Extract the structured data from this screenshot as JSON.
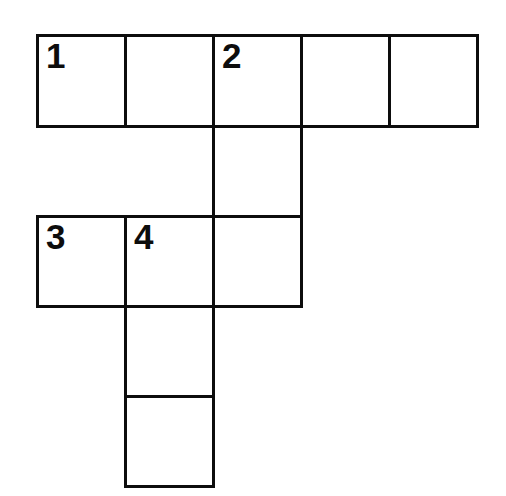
{
  "puzzle": {
    "type": "crossword-grid",
    "title": "Crossword Puzzle Grid",
    "background_color": "#ffffff",
    "line_color": "#0d0d0d",
    "line_width_px": 3,
    "cell_size_px": 88,
    "origin": {
      "x": 36,
      "y": 34
    },
    "columns": 5,
    "rows": 5,
    "column_edges_px": [
      36,
      124,
      212,
      300,
      388,
      476
    ],
    "row_edges_px": [
      34,
      125,
      215,
      305,
      395,
      485
    ],
    "cells": [
      {
        "row": 0,
        "col": 0,
        "number": "1",
        "letter": ""
      },
      {
        "row": 0,
        "col": 1,
        "number": "",
        "letter": ""
      },
      {
        "row": 0,
        "col": 2,
        "number": "2",
        "letter": ""
      },
      {
        "row": 0,
        "col": 3,
        "number": "",
        "letter": ""
      },
      {
        "row": 0,
        "col": 4,
        "number": "",
        "letter": ""
      },
      {
        "row": 1,
        "col": 2,
        "number": "",
        "letter": ""
      },
      {
        "row": 2,
        "col": 0,
        "number": "3",
        "letter": ""
      },
      {
        "row": 2,
        "col": 1,
        "number": "4",
        "letter": ""
      },
      {
        "row": 2,
        "col": 2,
        "number": "",
        "letter": ""
      },
      {
        "row": 3,
        "col": 1,
        "number": "",
        "letter": ""
      },
      {
        "row": 4,
        "col": 1,
        "number": "",
        "letter": ""
      }
    ],
    "clue_numbers": [
      "1",
      "2",
      "3",
      "4"
    ],
    "entries": [
      {
        "number": "1",
        "direction": "across",
        "start_row": 0,
        "start_col": 0,
        "length": 5
      },
      {
        "number": "2",
        "direction": "down",
        "start_row": 0,
        "start_col": 2,
        "length": 3
      },
      {
        "number": "3",
        "direction": "across",
        "start_row": 2,
        "start_col": 0,
        "length": 3
      },
      {
        "number": "4",
        "direction": "down",
        "start_row": 2,
        "start_col": 1,
        "length": 3
      }
    ]
  }
}
